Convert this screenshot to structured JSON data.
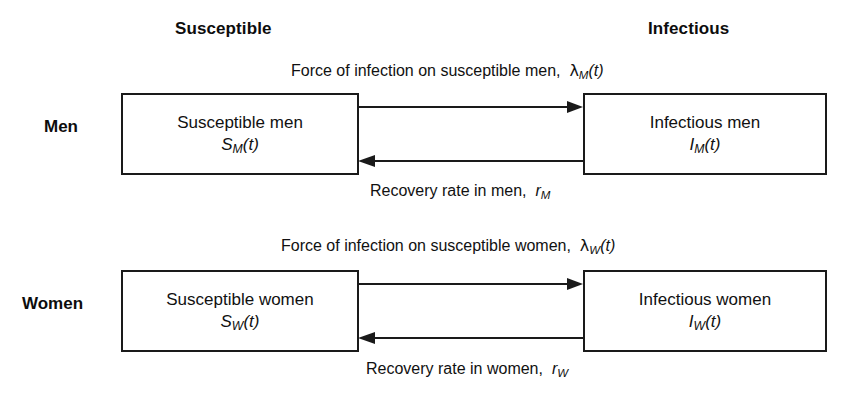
{
  "diagram": {
    "background_color": "#ffffff",
    "line_color": "#1a1a1a",
    "text_color": "#111111"
  },
  "column_headers": {
    "susceptible": "Susceptible",
    "infectious": "Infectious"
  },
  "row_labels": {
    "men": "Men",
    "women": "Women"
  },
  "boxes": {
    "susceptible_men": {
      "title": "Susceptible men",
      "symbol_base": "S",
      "symbol_sub": "M",
      "symbol_arg": "(t)"
    },
    "infectious_men": {
      "title": "Infectious men",
      "symbol_base": "I",
      "symbol_sub": "M",
      "symbol_arg": "(t)"
    },
    "susceptible_women": {
      "title": "Susceptible women",
      "symbol_base": "S",
      "symbol_sub": "W",
      "symbol_arg": "(t)"
    },
    "infectious_women": {
      "title": "Infectious women",
      "symbol_base": "I",
      "symbol_sub": "W",
      "symbol_arg": "(t)"
    }
  },
  "edges": {
    "foi_men": {
      "text": "Force of infection on susceptible men,",
      "symbol_base": "λ",
      "symbol_sub": "M",
      "symbol_arg": "(t)",
      "direction": "left-to-right"
    },
    "recovery_men": {
      "text": "Recovery rate in men,",
      "symbol_base": "r",
      "symbol_sub": "M",
      "symbol_arg": "",
      "direction": "right-to-left"
    },
    "foi_women": {
      "text": "Force of infection on susceptible women,",
      "symbol_base": "λ",
      "symbol_sub": "W",
      "symbol_arg": "(t)",
      "direction": "left-to-right"
    },
    "recovery_women": {
      "text": "Recovery rate in women,",
      "symbol_base": "r",
      "symbol_sub": "W",
      "symbol_arg": "",
      "direction": "right-to-left"
    }
  }
}
